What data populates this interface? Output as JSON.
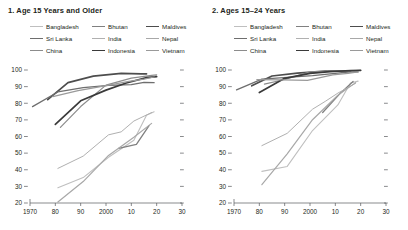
{
  "figure": {
    "panels": [
      {
        "title": "1. Age 15 Years and Older",
        "legend": [
          {
            "label": "Bangladesh",
            "color": "#bfbfbf",
            "width": 1.1
          },
          {
            "label": "Bhutan",
            "color": "#808080",
            "width": 1.3
          },
          {
            "label": "Maldives",
            "color": "#4d4d4d",
            "width": 1.7
          },
          {
            "label": "Sri Lanka",
            "color": "#6e6e6e",
            "width": 1.3
          },
          {
            "label": "India",
            "color": "#b0b0b0",
            "width": 1.0
          },
          {
            "label": "Nepal",
            "color": "#a8a8a8",
            "width": 1.2
          },
          {
            "label": "China",
            "color": "#8c8c8c",
            "width": 1.2
          },
          {
            "label": "Indonesia",
            "color": "#3a3a3a",
            "width": 1.7
          },
          {
            "label": "Vietnam",
            "color": "#9a9a9a",
            "width": 1.2
          }
        ],
        "chart_data": {
          "type": "line",
          "title": "1. Age 15 Years and Older",
          "xlabel": "",
          "ylabel": "",
          "xlim": [
            1970,
            2030
          ],
          "ylim": [
            20,
            100
          ],
          "xticks": [
            1970,
            1980,
            1990,
            2000,
            2010,
            2020,
            2030
          ],
          "xticklabels": [
            "1970",
            "80",
            "90",
            "2000",
            "10",
            "20",
            "30"
          ],
          "yticks": [
            20,
            30,
            40,
            50,
            60,
            70,
            80,
            90,
            100
          ],
          "yticklabels": [
            "20",
            "30",
            "40",
            "50",
            "60",
            "70",
            "80",
            "90",
            "100"
          ],
          "grid": false,
          "legend_position": "top",
          "series": [
            {
              "name": "Bangladesh",
              "color": "#bfbfbf",
              "width": 1.1,
              "x": [
                1981,
                1991,
                2001,
                2011,
                2016,
                2019
              ],
              "y": [
                29.2,
                35.3,
                47.5,
                57.7,
                72.8,
                74.9
              ]
            },
            {
              "name": "Bhutan",
              "color": "#808080",
              "width": 1.3,
              "x": [
                2005,
                2012,
                2017
              ],
              "y": [
                52.8,
                55.3,
                66.6
              ]
            },
            {
              "name": "Maldives",
              "color": "#4d4d4d",
              "width": 1.7,
              "x": [
                1977,
                1985,
                1995,
                2006,
                2014,
                2016
              ],
              "y": [
                82.2,
                92.4,
                96.3,
                98.0,
                97.7,
                97.7
              ]
            },
            {
              "name": "Sri Lanka",
              "color": "#6e6e6e",
              "width": 1.3,
              "x": [
                1971,
                1981,
                1991,
                2001,
                2010,
                2015,
                2019
              ],
              "y": [
                78.0,
                86.8,
                89.4,
                90.7,
                91.2,
                92.6,
                92.4
              ]
            },
            {
              "name": "India",
              "color": "#b0b0b0",
              "width": 1.0,
              "x": [
                1981,
                1991,
                2001,
                2006,
                2011,
                2018
              ],
              "y": [
                40.8,
                48.2,
                61.0,
                62.8,
                69.3,
                74.4
              ]
            },
            {
              "name": "Nepal",
              "color": "#a8a8a8",
              "width": 1.2,
              "x": [
                1981,
                1991,
                2001,
                2011,
                2018
              ],
              "y": [
                20.6,
                32.9,
                48.6,
                59.6,
                67.9
              ]
            },
            {
              "name": "China",
              "color": "#8c8c8c",
              "width": 1.2,
              "x": [
                1982,
                1990,
                2000,
                2010,
                2018,
                2020
              ],
              "y": [
                65.5,
                78.0,
                90.9,
                95.1,
                96.8,
                97.1
              ]
            },
            {
              "name": "Indonesia",
              "color": "#3a3a3a",
              "width": 1.7,
              "x": [
                1980,
                1990,
                2000,
                2008,
                2016,
                2020
              ],
              "y": [
                67.3,
                81.5,
                87.9,
                92.2,
                95.4,
                96.0
              ]
            },
            {
              "name": "Vietnam",
              "color": "#9a9a9a",
              "width": 1.2,
              "x": [
                1979,
                1989,
                1999,
                2009,
                2015,
                2019
              ],
              "y": [
                84.0,
                87.6,
                90.3,
                93.2,
                94.5,
                95.8
              ]
            }
          ]
        }
      },
      {
        "title": "2. Ages 15–24 Years",
        "legend": [
          {
            "label": "Bangladesh",
            "color": "#bfbfbf",
            "width": 1.1
          },
          {
            "label": "Bhutan",
            "color": "#808080",
            "width": 1.3
          },
          {
            "label": "Maldives",
            "color": "#4d4d4d",
            "width": 1.7
          },
          {
            "label": "Sri Lanka",
            "color": "#6e6e6e",
            "width": 1.3
          },
          {
            "label": "India",
            "color": "#b0b0b0",
            "width": 1.0
          },
          {
            "label": "Nepal",
            "color": "#a8a8a8",
            "width": 1.2
          },
          {
            "label": "China",
            "color": "#8c8c8c",
            "width": 1.2
          },
          {
            "label": "Indonesia",
            "color": "#3a3a3a",
            "width": 1.7
          },
          {
            "label": "Vietnam",
            "color": "#9a9a9a",
            "width": 1.2
          }
        ],
        "chart_data": {
          "type": "line",
          "title": "2. Ages 15–24 Years",
          "xlabel": "",
          "ylabel": "",
          "xlim": [
            1970,
            2030
          ],
          "ylim": [
            20,
            100
          ],
          "xticks": [
            1970,
            1980,
            1990,
            2000,
            2010,
            2020,
            2030
          ],
          "xticklabels": [
            "1970",
            "80",
            "90",
            "2000",
            "10",
            "20",
            "30"
          ],
          "yticks": [
            20,
            30,
            40,
            50,
            60,
            70,
            80,
            90,
            100
          ],
          "yticklabels": [
            "20",
            "30",
            "40",
            "50",
            "60",
            "70",
            "80",
            "90",
            "100"
          ],
          "grid": false,
          "legend_position": "top",
          "series": [
            {
              "name": "Bangladesh",
              "color": "#bfbfbf",
              "width": 1.1,
              "x": [
                1981,
                1991,
                2001,
                2011,
                2016,
                2019
              ],
              "y": [
                39.0,
                42.0,
                63.6,
                79.0,
                92.2,
                93.3
              ]
            },
            {
              "name": "Bhutan",
              "color": "#808080",
              "width": 1.3,
              "x": [
                2005,
                2012,
                2017
              ],
              "y": [
                74.4,
                86.1,
                93.1
              ]
            },
            {
              "name": "Maldives",
              "color": "#4d4d4d",
              "width": 1.7,
              "x": [
                1977,
                1985,
                1995,
                2006,
                2014,
                2016
              ],
              "y": [
                90.5,
                96.4,
                98.1,
                99.3,
                99.3,
                99.3
              ]
            },
            {
              "name": "Sri Lanka",
              "color": "#6e6e6e",
              "width": 1.3,
              "x": [
                1971,
                1981,
                1991,
                2001,
                2010,
                2015,
                2019
              ],
              "y": [
                88.0,
                94.5,
                95.6,
                96.6,
                98.0,
                98.8,
                98.9
              ]
            },
            {
              "name": "India",
              "color": "#b0b0b0",
              "width": 1.0,
              "x": [
                1981,
                1991,
                2001,
                2006,
                2011,
                2018
              ],
              "y": [
                54.5,
                61.9,
                76.4,
                81.1,
                86.1,
                92.0
              ]
            },
            {
              "name": "Nepal",
              "color": "#a8a8a8",
              "width": 1.2,
              "x": [
                1981,
                1991,
                2001,
                2011,
                2018
              ],
              "y": [
                31.0,
                49.6,
                70.1,
                84.8,
                92.4
              ]
            },
            {
              "name": "China",
              "color": "#8c8c8c",
              "width": 1.2,
              "x": [
                1982,
                1990,
                2000,
                2010,
                2018,
                2020
              ],
              "y": [
                91.5,
                94.3,
                98.9,
                99.4,
                99.7,
                99.8
              ]
            },
            {
              "name": "Indonesia",
              "color": "#3a3a3a",
              "width": 1.7,
              "x": [
                1980,
                1990,
                2000,
                2008,
                2016,
                2020
              ],
              "y": [
                86.4,
                95.0,
                98.0,
                99.0,
                99.7,
                99.8
              ]
            },
            {
              "name": "Vietnam",
              "color": "#9a9a9a",
              "width": 1.2,
              "x": [
                1979,
                1989,
                1999,
                2009,
                2015,
                2019
              ],
              "y": [
                94.2,
                94.1,
                93.8,
                97.1,
                98.0,
                98.8
              ]
            }
          ]
        }
      }
    ]
  }
}
